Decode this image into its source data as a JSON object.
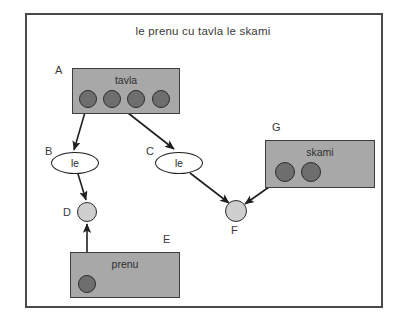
{
  "diagram": {
    "title": "le prenu cu tavla le skami",
    "frame": {
      "present": true
    },
    "boxes": [
      {
        "id": "A",
        "tag": "A",
        "label": "tavla",
        "x": 72,
        "y": 68,
        "w": 108,
        "h": 46,
        "tag_x": 55,
        "tag_y": 64,
        "fill": "#a8a8a8",
        "stroke": "#3d3d3d",
        "circles": [
          {
            "cx": 88,
            "cy": 99,
            "r": 9
          },
          {
            "cx": 112,
            "cy": 99,
            "r": 9
          },
          {
            "cx": 136,
            "cy": 99,
            "r": 9
          },
          {
            "cx": 161,
            "cy": 99,
            "r": 9
          }
        ]
      },
      {
        "id": "E",
        "tag": "E",
        "label": "prenu",
        "x": 70,
        "y": 252,
        "w": 110,
        "h": 46,
        "tag_x": 163,
        "tag_y": 233,
        "fill": "#a8a8a8",
        "stroke": "#3d3d3d",
        "circles": [
          {
            "cx": 87,
            "cy": 284,
            "r": 9
          }
        ]
      },
      {
        "id": "G",
        "tag": "G",
        "label": "skami",
        "x": 265,
        "y": 140,
        "w": 110,
        "h": 48,
        "tag_x": 272,
        "tag_y": 121,
        "fill": "#a8a8a8",
        "stroke": "#3d3d3d",
        "circles": [
          {
            "cx": 285,
            "cy": 172,
            "r": 10
          },
          {
            "cx": 311,
            "cy": 172,
            "r": 10
          }
        ]
      }
    ],
    "ellipses": [
      {
        "id": "B",
        "tag": "B",
        "label": "le",
        "cx": 75,
        "cy": 163,
        "rx": 24,
        "ry": 11,
        "tag_x": 45,
        "tag_y": 145
      },
      {
        "id": "C",
        "tag": "C",
        "label": "le",
        "cx": 179,
        "cy": 163,
        "rx": 24,
        "ry": 11,
        "tag_x": 146,
        "tag_y": 145
      }
    ],
    "nodes": [
      {
        "id": "D",
        "tag": "D",
        "cx": 87,
        "cy": 212,
        "r": 10,
        "tag_x": 63,
        "tag_y": 206,
        "fill": "#cfcfcf"
      },
      {
        "id": "F",
        "tag": "F",
        "cx": 236,
        "cy": 211,
        "r": 11,
        "tag_x": 231,
        "tag_y": 224,
        "fill": "#cfcfcf"
      }
    ],
    "edges": [
      {
        "from": "A.c1",
        "to": "B",
        "x1": 88,
        "y1": 102,
        "x2": 74,
        "y2": 150
      },
      {
        "from": "A.c2",
        "to": "C",
        "x1": 114,
        "y1": 102,
        "x2": 174,
        "y2": 149
      },
      {
        "from": "B",
        "to": "D",
        "x1": 78,
        "y1": 174,
        "x2": 86,
        "y2": 200
      },
      {
        "from": "E.c1",
        "to": "D",
        "x1": 87,
        "y1": 284,
        "x2": 87,
        "y2": 224
      },
      {
        "from": "C",
        "to": "F",
        "x1": 190,
        "y1": 173,
        "x2": 229,
        "y2": 203
      },
      {
        "from": "G.c1",
        "to": "F",
        "x1": 286,
        "y1": 175,
        "x2": 245,
        "y2": 204
      }
    ],
    "colors": {
      "box_fill": "#a8a8a8",
      "box_stroke": "#3d3d3d",
      "dark_circle": "#6e6e6e",
      "light_circle": "#cfcfcf",
      "edge": "#1f1f1f",
      "frame": "#4a4a4a",
      "text": "#2f2f2f"
    }
  }
}
